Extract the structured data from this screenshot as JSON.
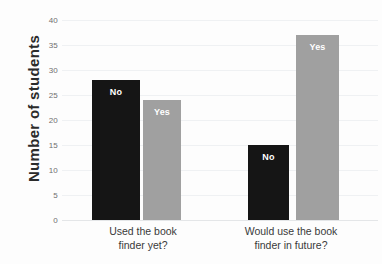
{
  "chart_data": {
    "type": "bar",
    "title": "",
    "subtitle": "",
    "xlabel": "",
    "ylabel": "Number  of students",
    "ylim": [
      0,
      40
    ],
    "yticks": [
      0,
      5,
      10,
      15,
      20,
      25,
      30,
      35,
      40
    ],
    "ytick_labels": [
      "0",
      "5",
      "10",
      "15",
      "20",
      "25",
      "30",
      "35",
      "40"
    ],
    "grid": true,
    "legend": "none",
    "categories": [
      "Used the book finder yet?",
      "Would use the book finder in future?"
    ],
    "category_lines": [
      [
        "Used the book",
        "finder yet?"
      ],
      [
        "Would use the book",
        "finder in future?"
      ]
    ],
    "series": [
      {
        "name": "No",
        "values": [
          28,
          15
        ],
        "color": "#151515"
      },
      {
        "name": "Yes",
        "values": [
          24,
          37
        ],
        "color": "#a0a0a0"
      }
    ],
    "bars": [
      {
        "group": 0,
        "series": "No",
        "label": "No",
        "value": 28,
        "color": "#151515"
      },
      {
        "group": 0,
        "series": "Yes",
        "label": "Yes",
        "value": 24,
        "color": "#a0a0a0"
      },
      {
        "group": 1,
        "series": "No",
        "label": "No",
        "value": 15,
        "color": "#151515"
      },
      {
        "group": 1,
        "series": "Yes",
        "label": "Yes",
        "value": 37,
        "color": "#a0a0a0"
      }
    ],
    "colors": {
      "no_bar": "#151515",
      "yes_bar": "#a0a0a0",
      "gridline": "#eff1f3",
      "background": "#fdfdfd",
      "tick_text": "#6f6f6f",
      "axis_title": "#2b2b2b",
      "bar_label_text": "#ffffff"
    }
  }
}
